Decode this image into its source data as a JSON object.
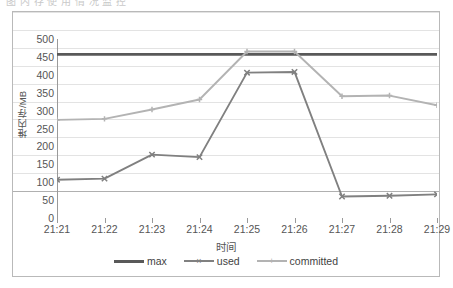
{
  "top_strip": {
    "ghost_text": "图 内 存 使 用 情 况 监 控"
  },
  "legend": {
    "position": "bottom",
    "items": [
      {
        "label": "max",
        "color": "#595959",
        "marker": "none"
      },
      {
        "label": "used",
        "color": "#808080",
        "marker": "x"
      },
      {
        "label": "committed",
        "color": "#b3b3b3",
        "marker": "plus"
      }
    ]
  },
  "axes": {
    "y_title": "堆内存/MB",
    "x_title": "时间",
    "y_ticks": [
      "0",
      "50",
      "100",
      "150",
      "200",
      "250",
      "300",
      "350",
      "400",
      "450",
      "500"
    ],
    "x_ticks": [
      "21:21",
      "21:22",
      "21:23",
      "21:24",
      "21:25",
      "21:26",
      "21:27",
      "21:28",
      "21:29"
    ]
  },
  "colors": {
    "max": "#595959",
    "used": "#808080",
    "committed": "#b3b3b3",
    "gridline": "#e3e3e3",
    "axis": "#9a9a9a",
    "border": "#b9b9b9",
    "text": "#555555",
    "background": "#ffffff"
  },
  "chart_data": {
    "type": "line",
    "title": "",
    "xlabel": "时间",
    "ylabel": "堆内存/MB",
    "categories": [
      "21:21",
      "21:22",
      "21:23",
      "21:24",
      "21:25",
      "21:26",
      "21:27",
      "21:28",
      "21:29"
    ],
    "ylim": [
      0,
      500
    ],
    "ytick_step": 50,
    "grid": true,
    "legend_position": "bottom",
    "series": [
      {
        "name": "max",
        "color": "#595959",
        "marker": "none",
        "values": [
          457,
          457,
          457,
          457,
          457,
          457,
          457,
          457,
          457
        ]
      },
      {
        "name": "used",
        "color": "#808080",
        "marker": "x",
        "values": [
          107,
          110,
          177,
          170,
          406,
          408,
          60,
          62,
          66
        ]
      },
      {
        "name": "committed",
        "color": "#b3b3b3",
        "marker": "plus",
        "values": [
          274,
          277,
          303,
          331,
          465,
          465,
          340,
          342,
          315
        ]
      }
    ]
  }
}
